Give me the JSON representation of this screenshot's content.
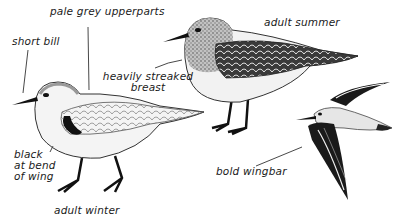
{
  "illustration": {
    "subject": "sanderling plumages",
    "figures": [
      {
        "id": "adult-winter",
        "caption": "adult winter"
      },
      {
        "id": "adult-summer",
        "caption": "adult summer"
      },
      {
        "id": "flight",
        "caption": ""
      }
    ]
  },
  "labels": {
    "pale_grey_upperparts": "pale grey upperparts",
    "short_bill": "short bill",
    "adult_summer": "adult summer",
    "heavily_streaked_line1": "heavily streaked",
    "heavily_streaked_line2": "breast",
    "black_line1": "black",
    "black_line2": "at bend",
    "black_line3": "of wing",
    "bold_wingbar": "bold wingbar",
    "adult_winter": "adult winter"
  },
  "colors": {
    "ink": "#1a1a1a",
    "pale_grey": "#d9d9d9",
    "mid_grey": "#9a9a9a",
    "background": "#ffffff"
  }
}
